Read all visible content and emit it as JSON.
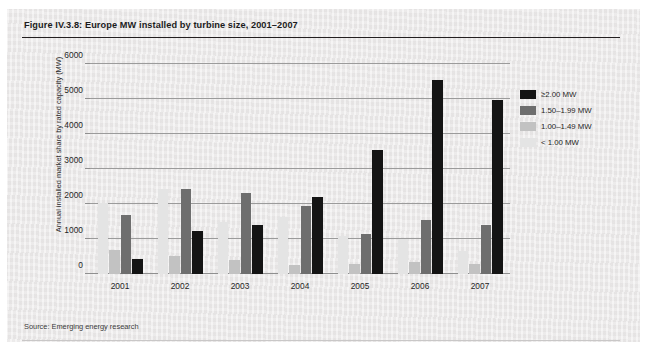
{
  "figure": {
    "title": "Figure IV.3.8: Europe MW installed by turbine size, 2001–2007",
    "source": "Source: Emerging energy research"
  },
  "chart_data": {
    "type": "bar",
    "title": "Europe MW installed by turbine size, 2001–2007",
    "xlabel": "",
    "ylabel": "Annual installed market share by rated capacity (MW)",
    "ylim": [
      0,
      6000
    ],
    "ytick_step": 1000,
    "yticks": [
      "0",
      "1000",
      "2000",
      "3000",
      "4000",
      "5000",
      "6000"
    ],
    "grid": true,
    "legend_position": "right-top",
    "categories": [
      "2001",
      "2002",
      "2003",
      "2004",
      "2005",
      "2006",
      "2007"
    ],
    "series": [
      {
        "name": "< 1.00 MW",
        "color": "#e4e4e4",
        "values": [
          2030,
          2440,
          1500,
          1630,
          1080,
          1000,
          660
        ]
      },
      {
        "name": "1.00–1.49 MW",
        "color": "#c2c2c2",
        "values": [
          700,
          520,
          390,
          250,
          290,
          330,
          300
        ]
      },
      {
        "name": "1.50–1.99 MW",
        "color": "#6e6e6e",
        "values": [
          1700,
          2420,
          2310,
          1930,
          1150,
          1540,
          1400
        ]
      },
      {
        "name": "≥2.00 MW",
        "color": "#141414",
        "values": [
          430,
          1240,
          1400,
          2200,
          3540,
          5550,
          4980
        ]
      }
    ]
  },
  "legend": {
    "items": [
      {
        "label": "≥2.00 MW",
        "color": "#141414"
      },
      {
        "label": "1.50–1.99 MW",
        "color": "#6e6e6e"
      },
      {
        "label": "1.00–1.49 MW",
        "color": "#c2c2c2"
      },
      {
        "label": "< 1.00 MW",
        "color": "#e4e4e4"
      }
    ]
  }
}
